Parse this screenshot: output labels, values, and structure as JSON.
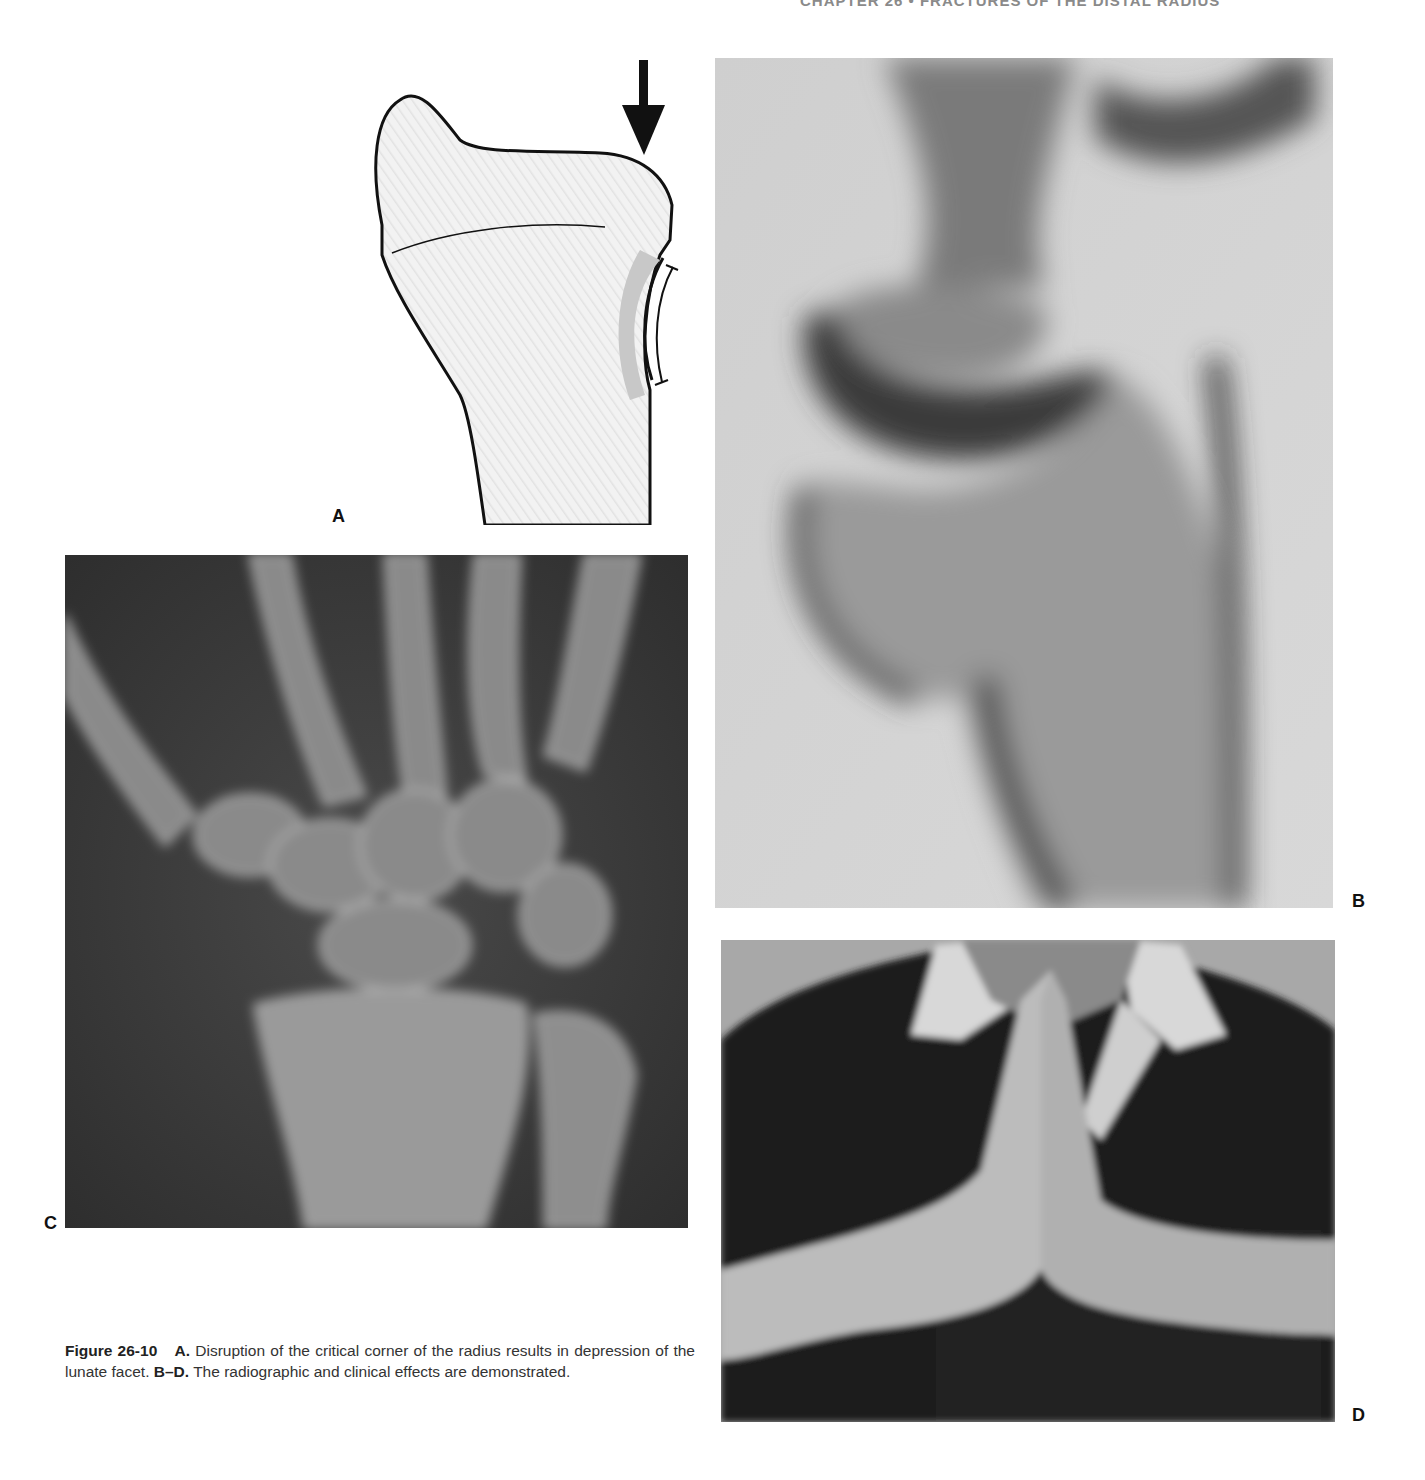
{
  "page": {
    "running_head": "CHAPTER 26 • FRACTURES OF THE DISTAL RADIUS"
  },
  "figure": {
    "number": "Figure 26-10",
    "panels": [
      {
        "label": "A",
        "type": "line-drawing",
        "description": "Distal radius outline with arrow indicating disruption of the critical corner and depressed lunate facet"
      },
      {
        "label": "B",
        "type": "radiograph",
        "description": "Lateral radiograph of wrist"
      },
      {
        "label": "C",
        "type": "radiograph",
        "description": "PA radiograph of wrist and carpus"
      },
      {
        "label": "D",
        "type": "clinical-photo",
        "description": "Patient pressing palms together showing limited wrist extension"
      }
    ],
    "caption": {
      "part_a_label": "A.",
      "part_a_text": "Disruption of the critical corner of the radius results in depression of the lunate facet.",
      "part_bd_label": "B–D.",
      "part_bd_text": "The radiographic and clinical effects are demonstrated."
    }
  }
}
